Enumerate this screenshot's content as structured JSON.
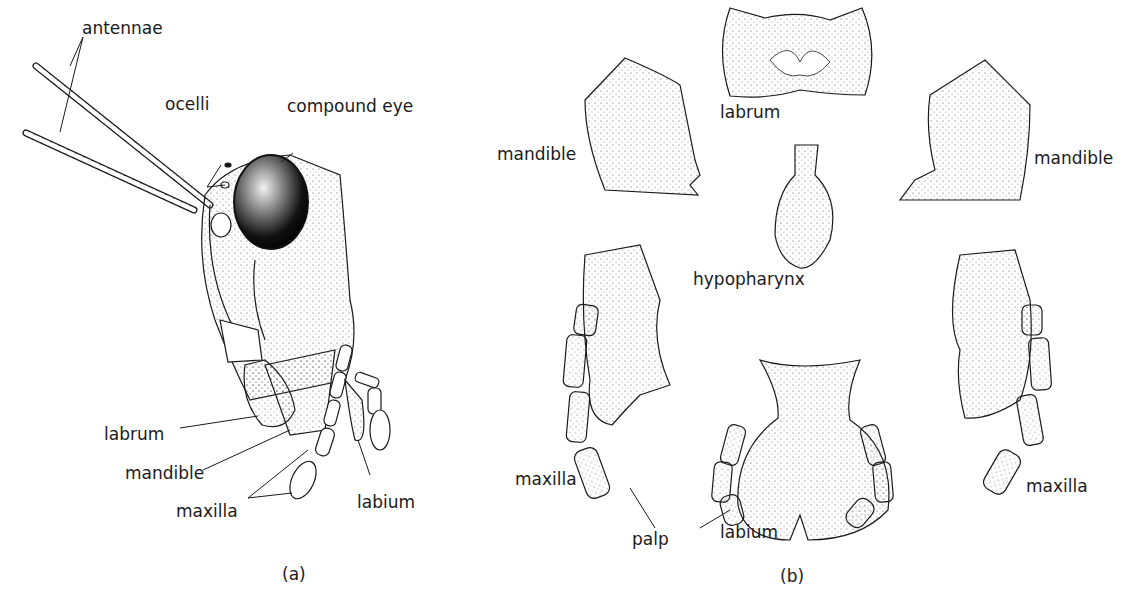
{
  "figure": {
    "panel_a": {
      "caption": "(a)",
      "labels": {
        "antennae": "antennae",
        "ocelli": "ocelli",
        "compound_eye": "compound eye",
        "labrum": "labrum",
        "mandible": "mandible",
        "maxilla": "maxilla",
        "labium": "labium"
      }
    },
    "panel_b": {
      "caption": "(b)",
      "labels": {
        "labrum": "labrum",
        "mandible_left": "mandible",
        "mandible_right": "mandible",
        "hypopharynx": "hypopharynx",
        "maxilla_left": "maxilla",
        "maxilla_right": "maxilla",
        "palp": "palp",
        "labium": "labium"
      }
    },
    "colors": {
      "ink": "#1a1a1a",
      "eye": "#111111",
      "background": "#ffffff"
    }
  }
}
